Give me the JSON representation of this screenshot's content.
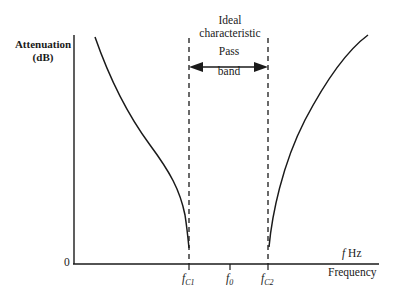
{
  "diagram": {
    "title_top": "Ideal",
    "title_bottom": "characteristic",
    "pass_band_top": "Pass",
    "pass_band_bottom": "band",
    "y_axis": {
      "label_top": "Attenuation",
      "label_bottom": "(dB)",
      "origin_label": "0"
    },
    "x_axis": {
      "unit_label_italic": "f",
      "unit_label_rest": " Hz",
      "label": "Frequency",
      "ticks": [
        {
          "main": "f",
          "sub": "C1"
        },
        {
          "main": "f",
          "sub": "0"
        },
        {
          "main": "f",
          "sub": "C2"
        }
      ]
    },
    "colors": {
      "line": "#1a1a1a",
      "background": "#ffffff"
    }
  }
}
